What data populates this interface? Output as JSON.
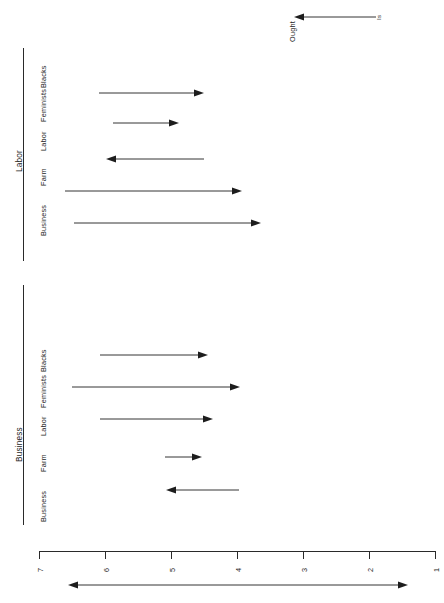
{
  "figure": {
    "orientation": "rotated-90",
    "scale_note": "horizontal axis runs 7 (left) to 1 (right)"
  },
  "legend": {
    "from_label": "Is",
    "to_label": "Ought",
    "arrow_direction": "left"
  },
  "axis": {
    "ticks": [
      "7",
      "6",
      "5",
      "4",
      "3",
      "2",
      "1"
    ],
    "tick_values": [
      7,
      6,
      5,
      4,
      3,
      2,
      1
    ],
    "range_arrow": "double-headed"
  },
  "panels": [
    {
      "title": "Labor",
      "categories": [
        "Blacks",
        "Feminists",
        "Labor",
        "Farm",
        "Business"
      ],
      "arrows": [
        {
          "group": "Blacks",
          "is": 6.0,
          "ought": 4.5
        },
        {
          "group": "Feminists",
          "is": 5.8,
          "ought": 5.0
        },
        {
          "group": "Labor",
          "is": 4.5,
          "ought": 5.8
        },
        {
          "group": "Farm",
          "is": 6.5,
          "ought": 4.0
        },
        {
          "group": "Business",
          "is": 6.3,
          "ought": 3.8
        }
      ]
    },
    {
      "title": "Business",
      "categories": [
        "Blacks",
        "Feminists",
        "Labor",
        "Farm",
        "Business"
      ],
      "arrows": [
        {
          "group": "Blacks",
          "is": 6.0,
          "ought": 4.4
        },
        {
          "group": "Feminists",
          "is": 6.5,
          "ought": 4.0
        },
        {
          "group": "Labor",
          "is": 6.0,
          "ought": 4.4
        },
        {
          "group": "Farm",
          "is": 5.1,
          "ought": 4.6
        },
        {
          "group": "Business",
          "is": 4.0,
          "ought": 5.05
        }
      ]
    }
  ],
  "colors": {
    "ink": "#1d1d1d",
    "rule": "#2a2a2a",
    "background": "#ffffff"
  }
}
